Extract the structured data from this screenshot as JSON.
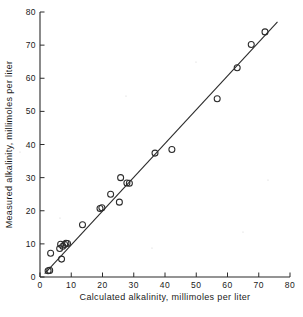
{
  "chart_data": {
    "type": "scatter",
    "title": "",
    "xlabel": "Calculated alkalinity, millimoles per liter",
    "ylabel": "Measured alkalinity, millimoles per liter",
    "xlim": [
      0,
      80
    ],
    "ylim": [
      0,
      80
    ],
    "xticks": [
      0,
      10,
      20,
      30,
      40,
      50,
      60,
      70,
      80
    ],
    "yticks": [
      0,
      10,
      20,
      30,
      40,
      50,
      60,
      70,
      80
    ],
    "xtick_labels": [
      "0",
      "10",
      "20",
      "30",
      "40",
      "50",
      "60",
      "70",
      "80"
    ],
    "ytick_labels": [
      "0",
      "10",
      "20",
      "30",
      "40",
      "50",
      "60",
      "70",
      "80"
    ],
    "grid": false,
    "legend": null,
    "marker": "open-circle",
    "series": [
      {
        "name": "Alkalinity samples",
        "points": [
          [
            2.6,
            1.9
          ],
          [
            3.1,
            2.0
          ],
          [
            3.4,
            7.2
          ],
          [
            6.3,
            8.6
          ],
          [
            6.6,
            9.9
          ],
          [
            6.9,
            5.4
          ],
          [
            7.3,
            9.3
          ],
          [
            7.9,
            9.8
          ],
          [
            8.3,
            10.2
          ],
          [
            8.8,
            10.1
          ],
          [
            13.6,
            15.8
          ],
          [
            19.2,
            20.7
          ],
          [
            19.8,
            20.9
          ],
          [
            22.6,
            25.0
          ],
          [
            25.4,
            22.6
          ],
          [
            25.8,
            30.0
          ],
          [
            27.8,
            28.4
          ],
          [
            28.6,
            28.3
          ],
          [
            36.8,
            37.4
          ],
          [
            42.2,
            38.5
          ],
          [
            56.7,
            53.8
          ],
          [
            63.1,
            63.2
          ],
          [
            67.6,
            70.2
          ],
          [
            72.0,
            74.0
          ]
        ]
      }
    ],
    "fit_line": {
      "name": "regression line",
      "x_start": 1.5,
      "y_start": 1.0,
      "x_end": 76.0,
      "y_end": 77.0
    }
  },
  "figure": {
    "background_color": "#ffffff",
    "ink_color": "#2b2b2b"
  }
}
